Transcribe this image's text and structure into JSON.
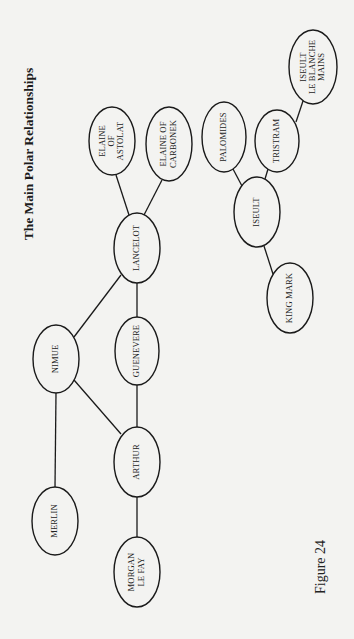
{
  "figure": {
    "title": "The Main Polar Relationships",
    "caption": "Figure 24",
    "colors": {
      "background": "#f3f3f1",
      "stroke": "#1a1a1a",
      "text": "#222222"
    }
  },
  "nodes": [
    {
      "id": "merlin",
      "lines": [
        "MERLIN"
      ],
      "cx": 55,
      "cy": 521,
      "rx": 23,
      "ry": 34
    },
    {
      "id": "nimue",
      "lines": [
        "NIMUE"
      ],
      "cx": 56,
      "cy": 359,
      "rx": 23,
      "ry": 34
    },
    {
      "id": "morgan-le-fay",
      "lines": [
        "MORGAN",
        "LE FAY"
      ],
      "cx": 137,
      "cy": 572,
      "rx": 23,
      "ry": 35
    },
    {
      "id": "arthur",
      "lines": [
        "ARTHUR"
      ],
      "cx": 137,
      "cy": 462,
      "rx": 23,
      "ry": 35
    },
    {
      "id": "guenevere",
      "lines": [
        "GUENEVERE"
      ],
      "cx": 137,
      "cy": 351,
      "rx": 22,
      "ry": 34
    },
    {
      "id": "lancelot",
      "lines": [
        "LANCELOT"
      ],
      "cx": 137,
      "cy": 248,
      "rx": 23,
      "ry": 35
    },
    {
      "id": "elaine-of-astolat",
      "lines": [
        "ELAINE",
        "OF",
        "ASTOLAT"
      ],
      "cx": 112,
      "cy": 141,
      "rx": 23,
      "ry": 34
    },
    {
      "id": "elaine-of-carbonek",
      "lines": [
        "ELAINE OF",
        "CARBONEK"
      ],
      "cx": 169,
      "cy": 144,
      "rx": 23,
      "ry": 37
    },
    {
      "id": "king-mark",
      "lines": [
        "KING MARK"
      ],
      "cx": 290,
      "cy": 298,
      "rx": 23,
      "ry": 35
    },
    {
      "id": "iseult",
      "lines": [
        "ISEULT"
      ],
      "cx": 257,
      "cy": 212,
      "rx": 23,
      "ry": 35
    },
    {
      "id": "palomides",
      "lines": [
        "PALOMIDES"
      ],
      "cx": 224,
      "cy": 137,
      "rx": 22,
      "ry": 35
    },
    {
      "id": "tristram",
      "lines": [
        "TRISTRAM"
      ],
      "cx": 277,
      "cy": 141,
      "rx": 22,
      "ry": 31
    },
    {
      "id": "iseult-le-blanche-mains",
      "lines": [
        "ISEULT",
        "LE BLANCHE",
        "MAINS"
      ],
      "cx": 313,
      "cy": 67,
      "rx": 24,
      "ry": 37
    }
  ],
  "edges": [
    {
      "from": "merlin",
      "to": "nimue",
      "x1": 55,
      "y1": 487,
      "x2": 56,
      "y2": 393
    },
    {
      "from": "nimue",
      "to": "arthur",
      "x1": 74,
      "y1": 380,
      "x2": 121,
      "y2": 434
    },
    {
      "from": "nimue",
      "to": "lancelot",
      "x1": 74,
      "y1": 337,
      "x2": 121,
      "y2": 275
    },
    {
      "from": "morgan-le-fay",
      "to": "arthur",
      "x1": 137,
      "y1": 537,
      "x2": 137,
      "y2": 497
    },
    {
      "from": "arthur",
      "to": "guenevere",
      "x1": 137,
      "y1": 427,
      "x2": 137,
      "y2": 385
    },
    {
      "from": "guenevere",
      "to": "lancelot",
      "x1": 137,
      "y1": 317,
      "x2": 137,
      "y2": 283
    },
    {
      "from": "lancelot",
      "to": "elaine-of-astolat",
      "x1": 129,
      "y1": 215,
      "x2": 116,
      "y2": 175
    },
    {
      "from": "lancelot",
      "to": "elaine-of-carbonek",
      "x1": 144,
      "y1": 215,
      "x2": 162,
      "y2": 180
    },
    {
      "from": "king-mark",
      "to": "iseult",
      "x1": 273,
      "y1": 274,
      "x2": 264,
      "y2": 246
    },
    {
      "from": "iseult",
      "to": "palomides",
      "x1": 242,
      "y1": 186,
      "x2": 233,
      "y2": 169
    },
    {
      "from": "iseult",
      "to": "tristram",
      "x1": 265,
      "y1": 179,
      "x2": 268,
      "y2": 169
    },
    {
      "from": "tristram",
      "to": "iseult-le-blanche-mains",
      "x1": 296,
      "y1": 122,
      "x2": 303,
      "y2": 101
    }
  ]
}
